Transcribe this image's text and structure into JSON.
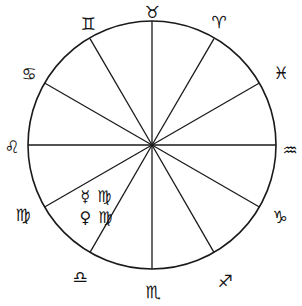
{
  "diagram": {
    "type": "astrological-chart-wheel",
    "stroke_color": "#1a1a1a",
    "background_color": "#ffffff",
    "circle": {
      "cx": 152,
      "cy": 145,
      "r": 124,
      "stroke_width": 1.6
    },
    "sector_count": 12
  },
  "wheel": {
    "spokes": [
      {
        "name": "cusp-taurus-gemini",
        "angle_deg": 90,
        "x2": 152,
        "y2": 21
      },
      {
        "name": "cusp-gemini-cancer",
        "angle_deg": 120,
        "x2": 90,
        "y2": 38.6
      },
      {
        "name": "cusp-cancer-leo",
        "angle_deg": 150,
        "x2": 44.6,
        "y2": 83
      },
      {
        "name": "cusp-leo-virgo",
        "angle_deg": 180,
        "x2": 28,
        "y2": 145
      },
      {
        "name": "cusp-virgo-libra",
        "angle_deg": 210,
        "x2": 44.6,
        "y2": 207
      },
      {
        "name": "cusp-libra-scorpio",
        "angle_deg": 240,
        "x2": 90,
        "y2": 252.4
      },
      {
        "name": "cusp-scorpio-sagittarius",
        "angle_deg": 270,
        "x2": 152,
        "y2": 269
      },
      {
        "name": "cusp-sagittarius-capricorn",
        "angle_deg": 300,
        "x2": 214,
        "y2": 252.4
      },
      {
        "name": "cusp-capricorn-aquarius",
        "angle_deg": 330,
        "x2": 259.4,
        "y2": 207
      },
      {
        "name": "cusp-aquarius-pisces",
        "angle_deg": 0,
        "x2": 276,
        "y2": 145
      },
      {
        "name": "cusp-pisces-aries",
        "angle_deg": 30,
        "x2": 259.4,
        "y2": 83
      },
      {
        "name": "cusp-aries-taurus",
        "angle_deg": 60,
        "x2": 214,
        "y2": 38.6
      }
    ]
  },
  "labels": [
    {
      "id": "taurus",
      "name": "Taurus",
      "glyph": "♉",
      "x": 152,
      "y": 12
    },
    {
      "id": "gemini",
      "name": "Gemini",
      "glyph": "♊",
      "x": 88,
      "y": 24
    },
    {
      "id": "cancer",
      "name": "Cancer",
      "glyph": "♋",
      "x": 29,
      "y": 74
    },
    {
      "id": "leo",
      "name": "Leo",
      "glyph": "♌",
      "x": 12,
      "y": 147
    },
    {
      "id": "virgo",
      "name": "Virgo",
      "glyph": "♍",
      "x": 23,
      "y": 215
    },
    {
      "id": "libra",
      "name": "Libra",
      "glyph": "♎",
      "x": 80,
      "y": 277
    },
    {
      "id": "scorpio",
      "name": "Scorpio",
      "glyph": "♏",
      "x": 153,
      "y": 292
    },
    {
      "id": "sagittarius",
      "name": "Sagittarius",
      "glyph": "♐",
      "x": 225,
      "y": 281
    },
    {
      "id": "capricorn",
      "name": "Capricorn",
      "glyph": "♑",
      "x": 280,
      "y": 217
    },
    {
      "id": "aquarius",
      "name": "Aquarius",
      "glyph": "♒",
      "x": 290,
      "y": 150
    },
    {
      "id": "pisces",
      "name": "Pisces",
      "glyph": "♓",
      "x": 281,
      "y": 73
    },
    {
      "id": "aries",
      "name": "Aries",
      "glyph": "♈",
      "x": 219,
      "y": 22
    }
  ],
  "annotations": [
    {
      "id": "mercury-in-virgo",
      "planet_name": "Mercury",
      "planet_glyph": "☿",
      "sign_name": "Virgo",
      "sign_glyph": "♍",
      "x": 96,
      "y": 197
    },
    {
      "id": "venus-in-virgo",
      "planet_name": "Venus",
      "planet_glyph": "♀",
      "sign_name": "Virgo",
      "sign_glyph": "♍",
      "x": 96,
      "y": 218
    }
  ]
}
